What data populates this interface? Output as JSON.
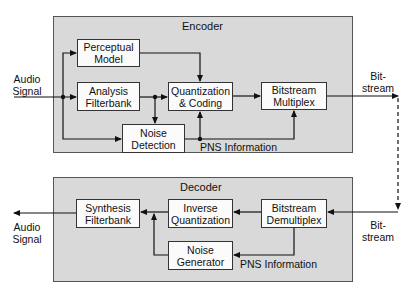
{
  "encoder": {
    "title": "Encoder",
    "blocks": {
      "perceptual_model": "Perceptual\nModel",
      "analysis_filterbank": "Analysis\nFilterbank",
      "quantization_coding": "Quantization\n& Coding",
      "bitstream_multiplex": "Bitstream\nMultiplex",
      "noise_detection": "Noise\nDetection"
    },
    "pns_label": "PNS Information"
  },
  "decoder": {
    "title": "Decoder",
    "blocks": {
      "synthesis_filterbank": "Synthesis\nFilterbank",
      "inverse_quantization": "Inverse\nQuantization",
      "bitstream_demultiplex": "Bitstream\nDemultiplex",
      "noise_generator": "Noise\nGenerator"
    },
    "pns_label": "PNS Information"
  },
  "signals": {
    "audio_in": "Audio\nSignal",
    "audio_out": "Audio\nSignal",
    "bitstream_out": "Bit-\nstream",
    "bitstream_in": "Bit-\nstream"
  }
}
